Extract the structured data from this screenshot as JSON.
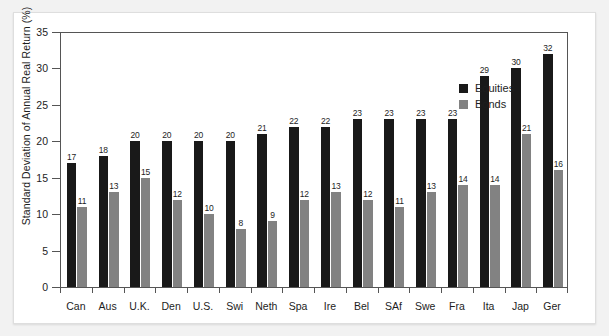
{
  "chart_data": {
    "type": "bar",
    "title": "",
    "subtitle": "",
    "xlabel": "",
    "ylabel": "Standard Deviation of Annual Real Return (%)",
    "ylim": [
      0,
      35
    ],
    "ytick_step": 5,
    "yticks": [
      0,
      5,
      10,
      15,
      20,
      25,
      30,
      35
    ],
    "grid": false,
    "legend_position": "top-right",
    "categories": [
      "Can",
      "Aus",
      "U.K.",
      "Den",
      "U.S.",
      "Swi",
      "Neth",
      "Spa",
      "Ire",
      "Bel",
      "SAf",
      "Swe",
      "Fra",
      "Ita",
      "Jap",
      "Ger"
    ],
    "series": [
      {
        "name": "Equities",
        "color": "#191919",
        "values": [
          17,
          18,
          20,
          20,
          20,
          20,
          21,
          22,
          22,
          23,
          23,
          23,
          23,
          29,
          30,
          32
        ]
      },
      {
        "name": "Bonds",
        "color": "#828282",
        "values": [
          11,
          13,
          15,
          12,
          10,
          8,
          9,
          12,
          13,
          12,
          11,
          13,
          14,
          14,
          21,
          16
        ]
      }
    ]
  },
  "legend": {
    "items": [
      {
        "label": "Equities",
        "color": "#191919"
      },
      {
        "label": "Bonds",
        "color": "#828282"
      }
    ]
  },
  "axes": {
    "y_title": "Standard Deviation of Annual Real Return (%)",
    "y_tick_labels": [
      "0",
      "5",
      "10",
      "15",
      "20",
      "25",
      "30",
      "35"
    ],
    "x_tick_labels": [
      "Can",
      "Aus",
      "U.K.",
      "Den",
      "U.S.",
      "Swi",
      "Neth",
      "Spa",
      "Ire",
      "Bel",
      "SAf",
      "Swe",
      "Fra",
      "Ita",
      "Jap",
      "Ger"
    ]
  },
  "colors": {
    "equities": "#191919",
    "bonds": "#828282",
    "axis": "#555555",
    "text": "#1d1d1d",
    "page": "#ffffff",
    "backdrop": "#f2f2f2"
  }
}
